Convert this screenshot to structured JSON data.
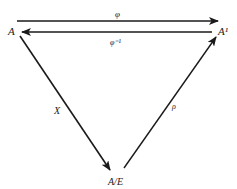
{
  "diagram": {
    "nodes": {
      "a": {
        "label": "A"
      },
      "a_prime": {
        "label": "A¹"
      },
      "quotient": {
        "label": "A/E"
      }
    },
    "edges": {
      "phi": {
        "label": "φ",
        "from": "A",
        "to": "A¹"
      },
      "phi_inv": {
        "label": "φ⁻¹",
        "from": "A¹",
        "to": "A"
      },
      "chi": {
        "label": "X",
        "from": "A",
        "to": "A/E"
      },
      "rho": {
        "label": "ρ",
        "from": "A/E",
        "to": "A¹"
      }
    },
    "colors": {
      "stroke": "#1a1a1a",
      "background": "#ffffff"
    }
  }
}
